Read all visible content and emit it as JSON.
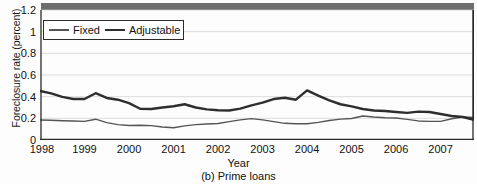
{
  "figure": {
    "caption": "(b) Prime loans",
    "top_banner_color": "#6e6e6e"
  },
  "chart_data": {
    "type": "line",
    "title": "",
    "subtitle": "",
    "caption": "(b) Prime loans",
    "xlabel": "Year",
    "ylabel": "Foreclosure rate (percent)",
    "ylim": [
      0,
      1.2
    ],
    "xlim": [
      1998.0,
      2007.75
    ],
    "grid": true,
    "grid_axis": "y",
    "legend_position": "upper-left-inside",
    "ytick_labels": [
      "0",
      "0.2",
      "0.4",
      "0.6",
      "0.8",
      "1",
      "1.2"
    ],
    "ytick_values": [
      0,
      0.2,
      0.4,
      0.6,
      0.8,
      1,
      1.2
    ],
    "xtick_labels": [
      "1998",
      "1999",
      "2000",
      "2001",
      "2002",
      "2003",
      "2004",
      "2005",
      "2006",
      "2007"
    ],
    "xtick_values": [
      1998,
      1999,
      2000,
      2001,
      2002,
      2003,
      2004,
      2005,
      2006,
      2007
    ],
    "x": [
      1998.0,
      1998.25,
      1998.5,
      1998.75,
      1999.0,
      1999.25,
      1999.5,
      1999.75,
      2000.0,
      2000.25,
      2000.5,
      2000.75,
      2001.0,
      2001.25,
      2001.5,
      2001.75,
      2002.0,
      2002.25,
      2002.5,
      2002.75,
      2003.0,
      2003.25,
      2003.5,
      2003.75,
      2004.0,
      2004.25,
      2004.5,
      2004.75,
      2005.0,
      2005.25,
      2005.5,
      2005.75,
      2006.0,
      2006.25,
      2006.5,
      2006.75,
      2007.0,
      2007.25,
      2007.5,
      2007.75
    ],
    "series": [
      {
        "name": "Fixed",
        "color": "#555555",
        "linewidth": 1.4,
        "values": [
          0.185,
          0.182,
          0.178,
          0.175,
          0.172,
          0.192,
          0.16,
          0.142,
          0.134,
          0.136,
          0.133,
          0.12,
          0.113,
          0.13,
          0.142,
          0.148,
          0.152,
          0.17,
          0.186,
          0.197,
          0.186,
          0.17,
          0.154,
          0.15,
          0.15,
          0.163,
          0.18,
          0.193,
          0.198,
          0.222,
          0.212,
          0.206,
          0.203,
          0.19,
          0.176,
          0.172,
          0.172,
          0.196,
          0.212,
          0.208
        ],
        "end_value": 0.283
      },
      {
        "name": "Adjustable",
        "color": "#2e2e2e",
        "linewidth": 2.4,
        "values": [
          0.452,
          0.43,
          0.398,
          0.378,
          0.378,
          0.432,
          0.388,
          0.372,
          0.34,
          0.288,
          0.286,
          0.3,
          0.312,
          0.33,
          0.3,
          0.283,
          0.275,
          0.272,
          0.29,
          0.32,
          0.345,
          0.378,
          0.39,
          0.372,
          0.458,
          0.41,
          0.366,
          0.33,
          0.31,
          0.286,
          0.272,
          0.268,
          0.258,
          0.25,
          0.262,
          0.258,
          0.24,
          0.222,
          0.212,
          0.186
        ],
        "end_value": 1.22
      }
    ],
    "annotations": [
      {
        "text": "Adjustable peaks at 0.46 in late 2001"
      },
      {
        "text": "Adjustable rises sharply from 0.33 in mid-2006 to 1.22 in late 2007"
      }
    ]
  },
  "legend": {
    "entries": [
      {
        "label": "Fixed",
        "swatch": "line-swatch-fixed"
      },
      {
        "label": "Adjustable",
        "swatch": "line-swatch-adjustable"
      }
    ]
  }
}
